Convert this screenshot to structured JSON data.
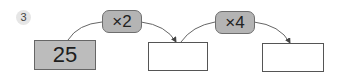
{
  "problem": {
    "number": "3",
    "start_value": "25",
    "operations": [
      {
        "label": "×2"
      },
      {
        "label": "×4"
      }
    ],
    "answer_boxes": [
      {
        "value": ""
      },
      {
        "value": ""
      }
    ]
  },
  "colors": {
    "filled_box": "#bcbcbc",
    "operator_pill": "#b4b4b4",
    "border": "#555555"
  }
}
